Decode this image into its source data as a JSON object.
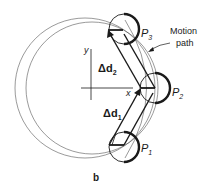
{
  "figure": {
    "panel_label": "b",
    "motion_path_label_line1": "Motion",
    "motion_path_label_line2": "path",
    "axes": {
      "x_label": "x",
      "y_label": "y"
    },
    "points": [
      {
        "name": "P",
        "sub": "1"
      },
      {
        "name": "P",
        "sub": "2"
      },
      {
        "name": "P",
        "sub": "3"
      }
    ],
    "displacements": [
      {
        "name": "Δd",
        "sub": "1"
      },
      {
        "name": "Δd",
        "sub": "2"
      }
    ]
  },
  "colors": {
    "ink": "#1a1a1a",
    "thin": "#555555"
  }
}
